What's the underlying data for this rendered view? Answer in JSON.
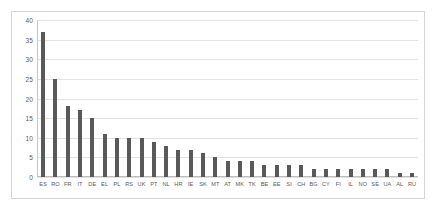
{
  "chart_data": {
    "type": "bar",
    "title": "",
    "subtitle": "",
    "xlabel": "",
    "ylabel": "",
    "ylim": [
      0,
      40
    ],
    "ytick_step": 5,
    "yticks": [
      40,
      35,
      30,
      25,
      20,
      15,
      10,
      5,
      0
    ],
    "grid": true,
    "legend": "none",
    "bar_color": "#595959",
    "gridline_color": "#e2e2e2",
    "border_color": "#d5d5d5",
    "background_color": "#ffffff",
    "label_color": "#5a5a5a",
    "categories": [
      "ES",
      "RO",
      "FR",
      "IT",
      "DE",
      "EL",
      "PL",
      "RS",
      "UK",
      "PT",
      "NL",
      "HR",
      "IE",
      "SK",
      "MT",
      "AT",
      "MK",
      "TK",
      "BE",
      "EE",
      "SI",
      "CH",
      "BG",
      "CY",
      "FI",
      "IL",
      "NO",
      "SE",
      "UA",
      "AL",
      "RU"
    ],
    "values": [
      37,
      25,
      18,
      17,
      15,
      11,
      10,
      10,
      10,
      9,
      8,
      7,
      7,
      6,
      5,
      4,
      4,
      4,
      3,
      3,
      3,
      3,
      2,
      2,
      2,
      2,
      2,
      2,
      2,
      1,
      1
    ]
  }
}
